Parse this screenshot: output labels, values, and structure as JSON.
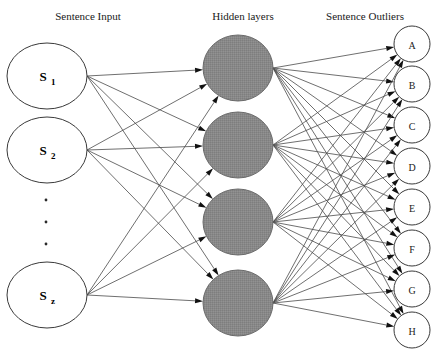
{
  "diagram": {
    "width": 442,
    "height": 361,
    "background_color": "#ffffff",
    "edge_color": "#4a4a4a",
    "arrow_color": "#111111",
    "headers": [
      {
        "id": "input-header",
        "label": "Sentence Input",
        "x": 88,
        "y": 20
      },
      {
        "id": "hidden-header",
        "label": "Hidden layers",
        "x": 243,
        "y": 20
      },
      {
        "id": "output-header",
        "label": "Sentence Outliers",
        "x": 365,
        "y": 20
      }
    ],
    "layers": {
      "input": {
        "name": "Sentence Input",
        "circle_fill": "#ffffff",
        "circle_stroke": "#3a3a3a",
        "rx": 40,
        "ry": 33,
        "nodes": [
          {
            "id": "s1",
            "base": "S",
            "sub": "1",
            "cx": 47,
            "cy": 76
          },
          {
            "id": "s2",
            "base": "S",
            "sub": "2",
            "cx": 47,
            "cy": 150
          },
          {
            "id": "sz",
            "base": "S",
            "sub": "z",
            "cx": 47,
            "cy": 295
          }
        ],
        "ellipsis": {
          "label": "vertical-ellipsis",
          "cx": 46,
          "dots": [
            200,
            222,
            244
          ],
          "radius": 1.4
        }
      },
      "hidden": {
        "name": "Hidden layers",
        "circle_fill": "#878787",
        "circle_stroke": "#6a6a6a",
        "rx": 35,
        "ry": 33,
        "nodes": [
          {
            "id": "h1",
            "label": "",
            "cx": 238,
            "cy": 68
          },
          {
            "id": "h2",
            "label": "",
            "cx": 238,
            "cy": 145
          },
          {
            "id": "h3",
            "label": "",
            "cx": 238,
            "cy": 222
          },
          {
            "id": "h4",
            "label": "",
            "cx": 238,
            "cy": 303
          }
        ]
      },
      "output": {
        "name": "Sentence Outliers",
        "circle_fill": "#ffffff",
        "circle_stroke": "#3a3a3a",
        "r": 18,
        "nodes": [
          {
            "id": "out-a",
            "label": "A",
            "cx": 412,
            "cy": 44
          },
          {
            "id": "out-b",
            "label": "B",
            "cx": 412,
            "cy": 84
          },
          {
            "id": "out-c",
            "label": "C",
            "cx": 412,
            "cy": 125
          },
          {
            "id": "out-d",
            "label": "D",
            "cx": 412,
            "cy": 166
          },
          {
            "id": "out-e",
            "label": "E",
            "cx": 412,
            "cy": 207
          },
          {
            "id": "out-f",
            "label": "F",
            "cx": 412,
            "cy": 248
          },
          {
            "id": "out-g",
            "label": "G",
            "cx": 412,
            "cy": 289
          },
          {
            "id": "out-h",
            "label": "H",
            "cx": 412,
            "cy": 330
          }
        ]
      }
    },
    "connections": {
      "input_to_hidden": "full",
      "hidden_to_output": "full",
      "arrowheads": "at-target",
      "arrow_length": 8,
      "arrow_width": 5
    }
  }
}
